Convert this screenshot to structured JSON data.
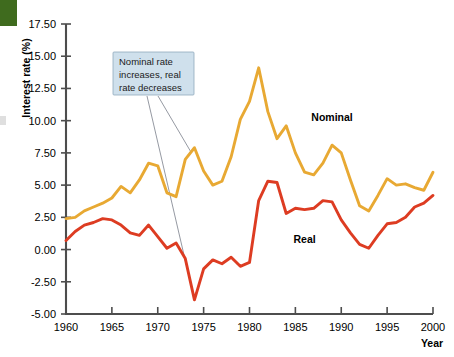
{
  "chart_data": {
    "type": "line",
    "title": "",
    "xlabel": "Year",
    "ylabel": "Interest rate (%)",
    "xlim": [
      1960,
      2000
    ],
    "ylim": [
      -5.0,
      17.5
    ],
    "xticks": [
      1960,
      1965,
      1970,
      1975,
      1980,
      1985,
      1990,
      1995,
      2000
    ],
    "xticklabels": [
      "1960",
      "1965",
      "1970",
      "1975",
      "1980",
      "1985",
      "1990",
      "1995",
      "2000"
    ],
    "yticks": [
      -5.0,
      -2.5,
      0.0,
      2.5,
      5.0,
      7.5,
      10.0,
      12.5,
      15.0,
      17.5
    ],
    "yticklabels": [
      "-5.00",
      "-2.50",
      "0.00",
      "2.50",
      "5.00",
      "7.50",
      "10.00",
      "12.50",
      "15.00",
      "17.50"
    ],
    "grid": false,
    "legend_position": "inline-labels",
    "x": [
      1960,
      1961,
      1962,
      1963,
      1964,
      1965,
      1966,
      1967,
      1968,
      1969,
      1970,
      1971,
      1972,
      1973,
      1974,
      1975,
      1976,
      1977,
      1978,
      1979,
      1980,
      1981,
      1982,
      1983,
      1984,
      1985,
      1986,
      1987,
      1988,
      1989,
      1990,
      1991,
      1992,
      1993,
      1994,
      1995,
      1996,
      1997,
      1998,
      1999,
      2000
    ],
    "series": [
      {
        "name": "Nominal",
        "color": "#e8a933",
        "values": [
          2.4,
          2.5,
          3.0,
          3.3,
          3.6,
          4.0,
          4.9,
          4.4,
          5.4,
          6.7,
          6.5,
          4.4,
          4.1,
          7.0,
          7.9,
          6.1,
          5.0,
          5.3,
          7.2,
          10.1,
          11.5,
          14.1,
          10.7,
          8.6,
          9.6,
          7.5,
          6.0,
          5.8,
          6.7,
          8.1,
          7.5,
          5.4,
          3.4,
          3.0,
          4.2,
          5.5,
          5.0,
          5.1,
          4.8,
          4.6,
          6.0
        ]
      },
      {
        "name": "Real",
        "color": "#dd3c22",
        "values": [
          0.7,
          1.4,
          1.9,
          2.1,
          2.4,
          2.3,
          1.9,
          1.3,
          1.1,
          1.9,
          1.0,
          0.1,
          0.5,
          -0.7,
          -3.9,
          -1.5,
          -0.8,
          -1.1,
          -0.6,
          -1.3,
          -1.0,
          3.8,
          5.3,
          5.2,
          2.8,
          3.2,
          3.1,
          3.2,
          3.8,
          3.7,
          2.3,
          1.3,
          0.4,
          0.1,
          1.1,
          2.0,
          2.1,
          2.5,
          3.3,
          3.6,
          4.2
        ]
      }
    ],
    "annotations": [
      {
        "text_lines": [
          "Nominal rate",
          "increases, real",
          "rate decreases"
        ],
        "box_fill": "#cfe0ec",
        "targets": [
          "real-1974-trough",
          "nominal-1974-peak"
        ]
      }
    ],
    "series_labels": [
      {
        "text": "Nominal",
        "x": 1989,
        "y": 10.0
      },
      {
        "text": "Real",
        "x": 1986,
        "y": 0.5
      }
    ]
  },
  "colors": {
    "nominal": "#e8a933",
    "real": "#dd3c22",
    "axis": "#4d4d4d",
    "annotation_fill": "#cfe0ec",
    "annotation_border": "#8fa9bd",
    "leader_line": "#7a7f8a",
    "corner_block": "#3f6b1e"
  }
}
